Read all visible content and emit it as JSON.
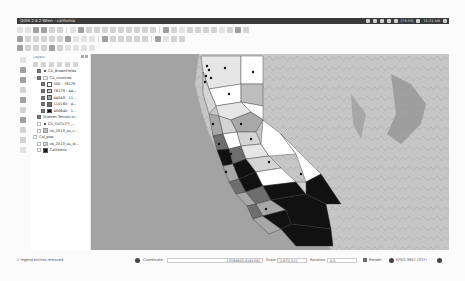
{
  "window": {
    "title": "QGIS 2.8.2-Wien - california",
    "tray": {
      "battery": "(73:33)",
      "volume_icon": "speaker-icon",
      "clock": "11:21 AM",
      "icons": [
        "dropbox-icon",
        "network-icon",
        "bluetooth-icon",
        "keyboard-icon",
        "battery-icon",
        "volume-icon",
        "power-gear-icon"
      ]
    }
  },
  "toolbars": {
    "row1": [
      "new-project",
      "open-project",
      "save-project",
      "save-as",
      "print-composer",
      "compose-manager",
      "touch-zoom",
      "pan",
      "pan-to-selection",
      "zoom-in",
      "zoom-out",
      "zoom-full",
      "zoom-to-selection",
      "zoom-to-layer",
      "zoom-last",
      "zoom-next",
      "refresh",
      "identify",
      "select",
      "deselect",
      "attribute-table",
      "field-calculator",
      "measure",
      "map-tips",
      "annotation",
      "text-annotation",
      "bookmarks",
      "help"
    ],
    "row2": [
      "current-edits",
      "toggle-editing",
      "save-edits",
      "add-feature",
      "move-feature",
      "node-tool",
      "delete-selected",
      "cut",
      "copy",
      "paste",
      "label-tool",
      "pin-labels",
      "show-labels",
      "move-label",
      "rotate-label",
      "change-label",
      "layer-styling",
      "plugin-a",
      "plugin-b",
      "python-console"
    ],
    "row3": [
      "add-vector",
      "add-raster",
      "add-postgis",
      "add-spatialite",
      "add-mssql",
      "add-oracle",
      "add-wms",
      "add-wcs",
      "add-wfs",
      "new-shapefile"
    ]
  },
  "layers_panel": {
    "title": "Layers",
    "items": [
      {
        "label": "CA_BrownFields",
        "checked": true,
        "symbol": "point",
        "indent": 0
      },
      {
        "label": "CA_counties",
        "checked": true,
        "symbol": "group",
        "indent": 0,
        "expanded": true
      },
      {
        "label": "500 - 76129",
        "checked": true,
        "swatch": "#ffffff",
        "indent": 1
      },
      {
        "label": "76129 - 44...",
        "checked": true,
        "swatch": "#d4d4d4",
        "indent": 1
      },
      {
        "label": "44048 - 11...",
        "checked": true,
        "swatch": "#a8a8a8",
        "indent": 1
      },
      {
        "label": "110180 - 4...",
        "checked": true,
        "swatch": "#6e6e6e",
        "indent": 1
      },
      {
        "label": "400640 - 1...",
        "checked": true,
        "swatch": "#111111",
        "indent": 1
      },
      {
        "label": "Stamen Terrain-Ix...",
        "checked": true,
        "symbol": "raster",
        "indent": 0
      },
      {
        "label": "CA_FACILITY_...",
        "checked": false,
        "symbol": "point",
        "indent": 0
      },
      {
        "label": "cb_2013_us_c...",
        "checked": false,
        "swatch": "#bdbdbd",
        "indent": 0
      },
      {
        "label": "Cal_pop",
        "checked": false,
        "symbol": "group",
        "indent": 0
      },
      {
        "label": "cb_2013_us_st...",
        "checked": false,
        "swatch": "#cfcfcf",
        "indent": 1
      },
      {
        "label": "California",
        "checked": false,
        "swatch": "#1a1a1a",
        "indent": 0
      }
    ]
  },
  "statusbar": {
    "message": "1 legend entries removed.",
    "coordinate_label": "Coordinate:",
    "coordinate_value": "-13398603,4161502",
    "scale_label": "Scale",
    "scale_value": "1:673,322",
    "rotation_label": "Rotation:",
    "rotation_value": "0.0",
    "render_label": "Render",
    "render_checked": true,
    "crs": "EPSG:3857 (OTF)"
  },
  "map": {
    "ocean_color": "#a3a3a3",
    "land_color": "#c4c4c4"
  }
}
